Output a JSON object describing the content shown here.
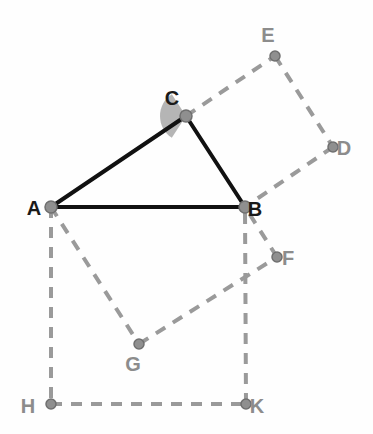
{
  "figure": {
    "background_color": "#fefefe",
    "solid_line_color": "#111111",
    "dashed_line_color": "#9a9a9a",
    "vertex_dot_color": "#8f8f8f",
    "vertex_dot_stroke": "#6f6f6f",
    "angle_fill_color": "#a8a8a8",
    "dark_label_color": "#1a1a1a",
    "gray_label_color": "#8c8c8c",
    "solid_stroke_width": 4,
    "dashed_stroke_width": 4,
    "dash_pattern": "11 9",
    "points": {
      "A": {
        "name": "A",
        "x": 51,
        "y": 207,
        "label_x": 34,
        "label_y": 215,
        "label_tone": "dark",
        "radius": 6
      },
      "B": {
        "name": "B",
        "x": 245,
        "y": 207,
        "label_x": 255,
        "label_y": 216,
        "label_tone": "dark",
        "radius": 6
      },
      "C": {
        "name": "C",
        "x": 186,
        "y": 116,
        "label_x": 172,
        "label_y": 105,
        "label_tone": "dark",
        "radius": 6
      },
      "D": {
        "name": "D",
        "x": 333,
        "y": 147,
        "label_x": 344,
        "label_y": 155,
        "label_tone": "gray",
        "radius": 5
      },
      "E": {
        "name": "E",
        "x": 275,
        "y": 56,
        "label_x": 268,
        "label_y": 42,
        "label_tone": "gray",
        "radius": 5
      },
      "F": {
        "name": "F",
        "x": 277,
        "y": 257,
        "label_x": 288,
        "label_y": 265,
        "label_tone": "gray",
        "radius": 5
      },
      "G": {
        "name": "G",
        "x": 139,
        "y": 344,
        "label_x": 133,
        "label_y": 371,
        "label_tone": "gray",
        "radius": 5
      },
      "H": {
        "name": "H",
        "x": 51,
        "y": 404,
        "label_x": 28,
        "label_y": 413,
        "label_tone": "gray",
        "radius": 5
      },
      "K": {
        "name": "K",
        "x": 246,
        "y": 404,
        "label_x": 257,
        "label_y": 413,
        "label_tone": "gray",
        "radius": 5
      }
    },
    "solid_segments": [
      {
        "name": "segment-AC",
        "from": "A",
        "to": "C"
      },
      {
        "name": "segment-CB",
        "from": "C",
        "to": "B"
      },
      {
        "name": "segment-AB",
        "from": "A",
        "to": "B"
      }
    ],
    "dashed_segments": [
      {
        "name": "segment-CE",
        "from": "C",
        "to": "E"
      },
      {
        "name": "segment-ED",
        "from": "E",
        "to": "D"
      },
      {
        "name": "segment-DB",
        "from": "D",
        "to": "B"
      },
      {
        "name": "segment-AH",
        "from": "A",
        "to": "H"
      },
      {
        "name": "segment-HK",
        "from": "H",
        "to": "K"
      },
      {
        "name": "segment-KB",
        "from": "K",
        "to": "B"
      },
      {
        "name": "segment-AG",
        "from": "A",
        "to": "G"
      },
      {
        "name": "segment-GF",
        "from": "G",
        "to": "F"
      },
      {
        "name": "segment-FB",
        "from": "F",
        "to": "B"
      }
    ],
    "angle_marker": {
      "name": "angle-at-C",
      "vertex": "C",
      "radius": 26,
      "start_angle_deg": 123,
      "end_angle_deg": 237,
      "fill": "#a8a8a8",
      "opacity": 0.85
    }
  }
}
